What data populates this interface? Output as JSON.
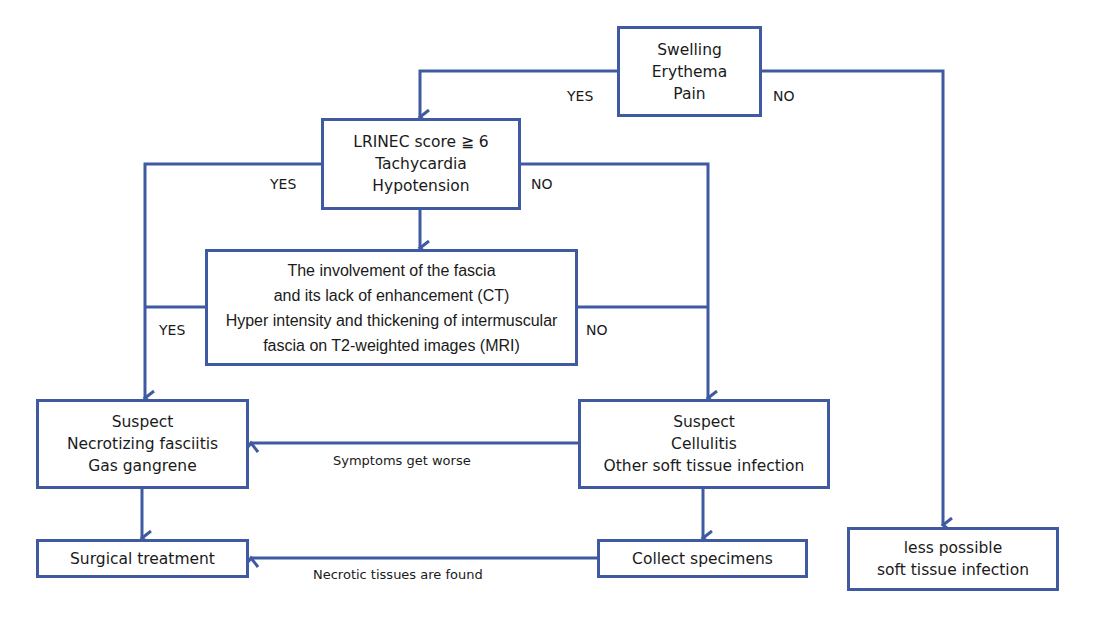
{
  "colors": {
    "line": "#3f5aa0",
    "box_border": "#3f5aa0",
    "text": "#1a1a1a",
    "background": "#ffffff"
  },
  "nodes": {
    "symptoms": {
      "lines": [
        "Swelling",
        "Erythema",
        "Pain"
      ]
    },
    "lrinec": {
      "lines": [
        "LRINEC score ≧ 6",
        "Tachycardia",
        "Hypotension"
      ]
    },
    "imaging": {
      "lines": [
        "The involvement of the fascia",
        "and its lack of enhancement (CT)",
        "Hyper intensity and thickening of intermuscular",
        "fascia on T2-weighted images (MRI)"
      ]
    },
    "necrotizing": {
      "lines": [
        "Suspect",
        "Necrotizing fasciitis",
        "Gas gangrene"
      ]
    },
    "cellulitis": {
      "lines": [
        "Suspect",
        "Cellulitis",
        "Other soft tissue infection"
      ]
    },
    "surgical": {
      "lines": [
        "Surgical treatment"
      ]
    },
    "specimens": {
      "lines": [
        "Collect specimens"
      ]
    },
    "less_possible": {
      "lines": [
        "less possible",
        "soft tissue infection"
      ]
    }
  },
  "edge_labels": {
    "symptoms_yes": "YES",
    "symptoms_no": "NO",
    "lrinec_yes": "YES",
    "lrinec_no": "NO",
    "imaging_yes": "YES",
    "imaging_no": "NO",
    "worse": "Symptoms get worse",
    "necrotic": "Necrotic tissues are found"
  }
}
